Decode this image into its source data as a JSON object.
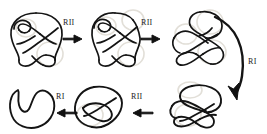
{
  "figure": {
    "type": "knot-diagram-reidemeister-sequence",
    "rows": 2,
    "stroke_color": "#141414",
    "ghost_color": "#e2dfd8",
    "background": "#ffffff"
  },
  "labels": {
    "move_rii_1": "RII",
    "move_rii_2": "RII",
    "move_ri_right": "RI",
    "move_rii_3": "RII",
    "move_ri_bottom": "RI"
  },
  "nodes": [
    {
      "id": "knot-1",
      "name": "knot-diagram-1",
      "row": "top",
      "position": "left",
      "crossings": 7
    },
    {
      "id": "knot-2",
      "name": "knot-diagram-2",
      "row": "top",
      "position": "middle",
      "crossings": 5
    },
    {
      "id": "knot-3",
      "name": "knot-diagram-3",
      "row": "top",
      "position": "right",
      "crossings": 4
    },
    {
      "id": "knot-4",
      "name": "knot-diagram-4",
      "row": "bottom",
      "position": "right",
      "crossings": 3
    },
    {
      "id": "knot-5",
      "name": "knot-diagram-5",
      "row": "bottom",
      "position": "middle",
      "crossings": 2
    },
    {
      "id": "knot-6",
      "name": "unknot-diagram",
      "row": "bottom",
      "position": "left",
      "crossings": 0
    }
  ],
  "arrows": [
    {
      "id": "arrow-1",
      "from": "knot-1",
      "to": "knot-2",
      "direction": "right",
      "label": "RII"
    },
    {
      "id": "arrow-2",
      "from": "knot-2",
      "to": "knot-3",
      "direction": "right",
      "label": "RII"
    },
    {
      "id": "arrow-3",
      "from": "knot-3",
      "to": "knot-4",
      "direction": "curved-down",
      "label": "RI"
    },
    {
      "id": "arrow-4",
      "from": "knot-4",
      "to": "knot-5",
      "direction": "left",
      "label": "RII"
    },
    {
      "id": "arrow-5",
      "from": "knot-5",
      "to": "knot-6",
      "direction": "left",
      "label": "RI"
    }
  ]
}
